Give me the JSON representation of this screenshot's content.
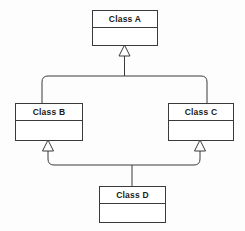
{
  "diagram": {
    "kind": "uml-class-diagram",
    "notation": "generalization",
    "background_color": "#fdfdfd",
    "line_color": "#3a3a3a",
    "box_fill_color": "#ffffff",
    "text_color": "#1a1a1a",
    "classes": [
      {
        "id": "class-a",
        "name": "Class A",
        "x": 92,
        "y": 10,
        "width": 65,
        "height": 35,
        "divider_offset": 17
      },
      {
        "id": "class-b",
        "name": "Class B",
        "x": 15,
        "y": 103,
        "width": 67,
        "height": 37,
        "divider_offset": 17
      },
      {
        "id": "class-c",
        "name": "Class C",
        "x": 168,
        "y": 103,
        "width": 65,
        "height": 37,
        "divider_offset": 17
      },
      {
        "id": "class-d",
        "name": "Class D",
        "x": 99,
        "y": 186,
        "width": 66,
        "height": 36,
        "divider_offset": 17
      }
    ],
    "relationships": [
      {
        "id": "gen-b-to-a",
        "type": "generalization",
        "source": "class-b",
        "target": "class-a",
        "label": ""
      },
      {
        "id": "gen-c-to-a",
        "type": "generalization",
        "source": "class-c",
        "target": "class-a",
        "label": ""
      },
      {
        "id": "gen-d-to-b",
        "type": "generalization",
        "source": "class-d",
        "target": "class-b",
        "label": ""
      },
      {
        "id": "gen-d-to-c",
        "type": "generalization",
        "source": "class-d",
        "target": "class-c",
        "label": ""
      }
    ]
  }
}
